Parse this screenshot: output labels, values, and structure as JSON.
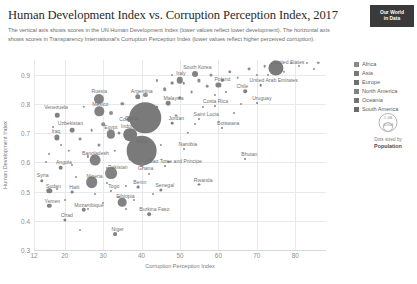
{
  "header": {
    "title": "Human Development Index vs. Corruption Perception Index, 2017",
    "subtitle": "The vertical axis shows scores in the UN Human Development Index (lower values reflect lower development). The horizontal axis shows scores in Transparency International's Corruption Perception Index (lower values reflect higher perceived corruption).",
    "logo_line1": "Our World",
    "logo_line2": "in Data"
  },
  "legend": {
    "entries": [
      {
        "label": "Africa",
        "color": "#8a8a8a"
      },
      {
        "label": "Asia",
        "color": "#787878"
      },
      {
        "label": "Europe",
        "color": "#6e6e6e"
      },
      {
        "label": "North America",
        "color": "#828282"
      },
      {
        "label": "Oceania",
        "color": "#747474"
      },
      {
        "label": "South America",
        "color": "#6a6a6a"
      }
    ],
    "size_legend": {
      "big_label": "1.4B",
      "small_label": "400M",
      "caption_top": "Dots sized by",
      "caption_bottom": "Population"
    }
  },
  "chart_data": {
    "type": "scatter",
    "title": "Human Development Index vs. Corruption Perception Index, 2017",
    "xlabel": "Corruption Perception Index",
    "ylabel": "Human Development Index",
    "xlim": [
      12,
      88
    ],
    "ylim": [
      0.3,
      0.95
    ],
    "xticks": [
      12,
      20,
      30,
      40,
      50,
      60,
      70,
      80
    ],
    "yticks": [
      0.3,
      0.4,
      0.5,
      0.6,
      0.7,
      0.8,
      0.9
    ],
    "grid": true,
    "legend_position": "right",
    "size_encoding": "population",
    "points": [
      {
        "name": "Venezuela",
        "x": 18,
        "y": 0.761,
        "pop": 29,
        "label": true,
        "lx": -1,
        "ly": -8
      },
      {
        "name": "Russia",
        "x": 29,
        "y": 0.816,
        "pop": 145,
        "label": true,
        "lx": 0,
        "ly": -8
      },
      {
        "name": "Mexico",
        "x": 29,
        "y": 0.774,
        "pop": 125,
        "label": true,
        "lx": 1,
        "ly": -7
      },
      {
        "name": "Uzbekistan",
        "x": 22,
        "y": 0.71,
        "pop": 32,
        "label": true,
        "lx": -2,
        "ly": -7
      },
      {
        "name": "Iraq",
        "x": 18,
        "y": 0.685,
        "pop": 38,
        "label": true,
        "lx": -1,
        "ly": -6
      },
      {
        "name": "Egypt",
        "x": 32,
        "y": 0.696,
        "pop": 97,
        "label": true,
        "lx": 0,
        "ly": -7
      },
      {
        "name": "Indonesia",
        "x": 37,
        "y": 0.694,
        "pop": 264,
        "label": true,
        "lx": 2,
        "ly": -9
      },
      {
        "name": "Colombia",
        "x": 37,
        "y": 0.747,
        "pop": 49,
        "label": true,
        "lx": 0,
        "ly": 0
      },
      {
        "name": "China",
        "x": 41,
        "y": 0.752,
        "pop": 1410,
        "label": true,
        "lx": -14,
        "ly": 0
      },
      {
        "name": "India",
        "x": 40,
        "y": 0.64,
        "pop": 1339,
        "label": true,
        "lx": 0,
        "ly": -10
      },
      {
        "name": "Bangladesh",
        "x": 28,
        "y": 0.608,
        "pop": 165,
        "label": true,
        "lx": 0,
        "ly": -7
      },
      {
        "name": "Pakistan",
        "x": 32,
        "y": 0.562,
        "pop": 197,
        "label": true,
        "lx": 7,
        "ly": -6
      },
      {
        "name": "Nigeria",
        "x": 27,
        "y": 0.532,
        "pop": 191,
        "label": true,
        "lx": 3,
        "ly": -6
      },
      {
        "name": "Ethiopia",
        "x": 35,
        "y": 0.463,
        "pop": 105,
        "label": true,
        "lx": 3,
        "ly": -6
      },
      {
        "name": "Angola",
        "x": 19,
        "y": 0.581,
        "pop": 30,
        "label": true,
        "lx": 3,
        "ly": -6
      },
      {
        "name": "Syria",
        "x": 14,
        "y": 0.536,
        "pop": 17,
        "label": true,
        "lx": 1,
        "ly": -6
      },
      {
        "name": "Sudan",
        "x": 16,
        "y": 0.502,
        "pop": 41,
        "label": true,
        "lx": 4,
        "ly": -5
      },
      {
        "name": "Haiti",
        "x": 22,
        "y": 0.498,
        "pop": 11,
        "label": true,
        "lx": 2,
        "ly": -5
      },
      {
        "name": "Yemen",
        "x": 16,
        "y": 0.452,
        "pop": 28,
        "label": true,
        "lx": 3,
        "ly": -5
      },
      {
        "name": "Chad",
        "x": 20,
        "y": 0.404,
        "pop": 15,
        "label": true,
        "lx": 2,
        "ly": -5
      },
      {
        "name": "Niger",
        "x": 33,
        "y": 0.354,
        "pop": 21,
        "label": true,
        "lx": 3,
        "ly": -5
      },
      {
        "name": "Mozambique",
        "x": 25,
        "y": 0.437,
        "pop": 29,
        "label": true,
        "lx": 5,
        "ly": -5
      },
      {
        "name": "Togo",
        "x": 32,
        "y": 0.503,
        "pop": 7,
        "label": true,
        "lx": 3,
        "ly": -5
      },
      {
        "name": "Benin",
        "x": 39,
        "y": 0.515,
        "pop": 11,
        "label": true,
        "lx": 2,
        "ly": -5
      },
      {
        "name": "Senegal",
        "x": 45,
        "y": 0.505,
        "pop": 15,
        "label": true,
        "lx": 4,
        "ly": -5
      },
      {
        "name": "Ghana",
        "x": 40,
        "y": 0.592,
        "pop": 29,
        "label": true,
        "lx": 4,
        "ly": 3
      },
      {
        "name": "Rwanda",
        "x": 55,
        "y": 0.524,
        "pop": 12,
        "label": true,
        "lx": 4,
        "ly": -5
      },
      {
        "name": "Burkina Faso",
        "x": 42,
        "y": 0.423,
        "pop": 19,
        "label": true,
        "lx": 5,
        "ly": -5
      },
      {
        "name": "Namibia",
        "x": 51,
        "y": 0.647,
        "pop": 2,
        "label": true,
        "lx": 4,
        "ly": -5
      },
      {
        "name": "Sao Tome and Principe",
        "x": 46,
        "y": 0.589,
        "pop": 0.2,
        "label": true,
        "lx": 11,
        "ly": -5
      },
      {
        "name": "Botswana",
        "x": 61,
        "y": 0.717,
        "pop": 2,
        "label": true,
        "lx": 6,
        "ly": -5
      },
      {
        "name": "Saint Lucia",
        "x": 55,
        "y": 0.747,
        "pop": 0.2,
        "label": true,
        "lx": 7,
        "ly": -5
      },
      {
        "name": "Bhutan",
        "x": 67,
        "y": 0.612,
        "pop": 0.8,
        "label": true,
        "lx": 4,
        "ly": -5
      },
      {
        "name": "Jordan",
        "x": 48,
        "y": 0.735,
        "pop": 10,
        "label": true,
        "lx": 4,
        "ly": -5
      },
      {
        "name": "Malaysia",
        "x": 47,
        "y": 0.802,
        "pop": 32,
        "label": true,
        "lx": 5,
        "ly": -5
      },
      {
        "name": "Argentina",
        "x": 39,
        "y": 0.825,
        "pop": 44,
        "label": true,
        "lx": 4,
        "ly": -6
      },
      {
        "name": "Italy",
        "x": 50,
        "y": 0.88,
        "pop": 59,
        "label": true,
        "lx": 1,
        "ly": -7
      },
      {
        "name": "Greece",
        "x": 48,
        "y": 0.87,
        "pop": 11,
        "label": false,
        "lx": 0,
        "ly": 0
      },
      {
        "name": "South Korea",
        "x": 54,
        "y": 0.903,
        "pop": 51,
        "label": true,
        "lx": 2,
        "ly": -7
      },
      {
        "name": "Poland",
        "x": 60,
        "y": 0.865,
        "pop": 38,
        "label": true,
        "lx": 4,
        "ly": -6
      },
      {
        "name": "Chile",
        "x": 67,
        "y": 0.843,
        "pop": 18,
        "label": true,
        "lx": -3,
        "ly": -5
      },
      {
        "name": "Uruguay",
        "x": 70,
        "y": 0.804,
        "pop": 3,
        "label": true,
        "lx": 5,
        "ly": -5
      },
      {
        "name": "Costa Rica",
        "x": 59,
        "y": 0.794,
        "pop": 5,
        "label": true,
        "lx": 1,
        "ly": -5
      },
      {
        "name": "United Arab Emirates",
        "x": 71,
        "y": 0.863,
        "pop": 9,
        "label": true,
        "lx": 13,
        "ly": -5
      },
      {
        "name": "United States",
        "x": 75,
        "y": 0.924,
        "pop": 325,
        "label": true,
        "lx": 13,
        "ly": -6
      }
    ],
    "unlabeled_points": [
      {
        "x": 15,
        "y": 0.6,
        "pop": 5
      },
      {
        "x": 17,
        "y": 0.72,
        "pop": 4
      },
      {
        "x": 21,
        "y": 0.64,
        "pop": 8
      },
      {
        "x": 23,
        "y": 0.55,
        "pop": 6
      },
      {
        "x": 24,
        "y": 0.68,
        "pop": 12
      },
      {
        "x": 25,
        "y": 0.79,
        "pop": 9
      },
      {
        "x": 26,
        "y": 0.62,
        "pop": 7
      },
      {
        "x": 27,
        "y": 0.71,
        "pop": 10
      },
      {
        "x": 28,
        "y": 0.49,
        "pop": 5
      },
      {
        "x": 29,
        "y": 0.66,
        "pop": 14
      },
      {
        "x": 30,
        "y": 0.73,
        "pop": 18
      },
      {
        "x": 31,
        "y": 0.58,
        "pop": 6
      },
      {
        "x": 32,
        "y": 0.77,
        "pop": 22
      },
      {
        "x": 33,
        "y": 0.64,
        "pop": 9
      },
      {
        "x": 34,
        "y": 0.7,
        "pop": 13
      },
      {
        "x": 35,
        "y": 0.8,
        "pop": 16
      },
      {
        "x": 36,
        "y": 0.52,
        "pop": 7
      },
      {
        "x": 37,
        "y": 0.61,
        "pop": 11
      },
      {
        "x": 38,
        "y": 0.74,
        "pop": 20
      },
      {
        "x": 39,
        "y": 0.68,
        "pop": 8
      },
      {
        "x": 41,
        "y": 0.83,
        "pop": 24
      },
      {
        "x": 42,
        "y": 0.56,
        "pop": 5
      },
      {
        "x": 43,
        "y": 0.72,
        "pop": 10
      },
      {
        "x": 44,
        "y": 0.79,
        "pop": 15
      },
      {
        "x": 45,
        "y": 0.66,
        "pop": 7
      },
      {
        "x": 46,
        "y": 0.85,
        "pop": 19
      },
      {
        "x": 47,
        "y": 0.6,
        "pop": 6
      },
      {
        "x": 49,
        "y": 0.76,
        "pop": 12
      },
      {
        "x": 50,
        "y": 0.82,
        "pop": 17
      },
      {
        "x": 51,
        "y": 0.87,
        "pop": 9
      },
      {
        "x": 52,
        "y": 0.7,
        "pop": 8
      },
      {
        "x": 53,
        "y": 0.84,
        "pop": 11
      },
      {
        "x": 55,
        "y": 0.88,
        "pop": 14
      },
      {
        "x": 56,
        "y": 0.79,
        "pop": 6
      },
      {
        "x": 57,
        "y": 0.86,
        "pop": 10
      },
      {
        "x": 58,
        "y": 0.9,
        "pop": 13
      },
      {
        "x": 61,
        "y": 0.88,
        "pop": 8
      },
      {
        "x": 62,
        "y": 0.84,
        "pop": 5
      },
      {
        "x": 63,
        "y": 0.91,
        "pop": 17
      },
      {
        "x": 65,
        "y": 0.89,
        "pop": 9
      },
      {
        "x": 68,
        "y": 0.92,
        "pop": 12
      },
      {
        "x": 70,
        "y": 0.9,
        "pop": 7
      },
      {
        "x": 72,
        "y": 0.93,
        "pop": 10
      },
      {
        "x": 73,
        "y": 0.9,
        "pop": 6
      },
      {
        "x": 76,
        "y": 0.93,
        "pop": 17
      },
      {
        "x": 77,
        "y": 0.91,
        "pop": 8
      },
      {
        "x": 79,
        "y": 0.94,
        "pop": 5
      },
      {
        "x": 81,
        "y": 0.93,
        "pop": 6
      },
      {
        "x": 83,
        "y": 0.94,
        "pop": 5
      },
      {
        "x": 85,
        "y": 0.92,
        "pop": 5
      },
      {
        "x": 86,
        "y": 0.94,
        "pop": 9
      },
      {
        "x": 43,
        "y": 0.49,
        "pop": 4
      },
      {
        "x": 36,
        "y": 0.44,
        "pop": 4
      },
      {
        "x": 30,
        "y": 0.46,
        "pop": 5
      },
      {
        "x": 26,
        "y": 0.44,
        "pop": 4
      },
      {
        "x": 24,
        "y": 0.37,
        "pop": 3
      },
      {
        "x": 20,
        "y": 0.47,
        "pop": 4
      },
      {
        "x": 18,
        "y": 0.51,
        "pop": 5
      },
      {
        "x": 34,
        "y": 0.48,
        "pop": 4
      },
      {
        "x": 38,
        "y": 0.47,
        "pop": 4
      },
      {
        "x": 31,
        "y": 0.53,
        "pop": 5
      },
      {
        "x": 22,
        "y": 0.59,
        "pop": 4
      },
      {
        "x": 19,
        "y": 0.66,
        "pop": 5
      },
      {
        "x": 16,
        "y": 0.63,
        "pop": 4
      },
      {
        "x": 44,
        "y": 0.88,
        "pop": 7
      },
      {
        "x": 48,
        "y": 0.9,
        "pop": 6
      },
      {
        "x": 66,
        "y": 0.8,
        "pop": 5
      },
      {
        "x": 59,
        "y": 0.83,
        "pop": 6
      },
      {
        "x": 64,
        "y": 0.77,
        "pop": 4
      },
      {
        "x": 54,
        "y": 0.73,
        "pop": 5
      }
    ]
  }
}
